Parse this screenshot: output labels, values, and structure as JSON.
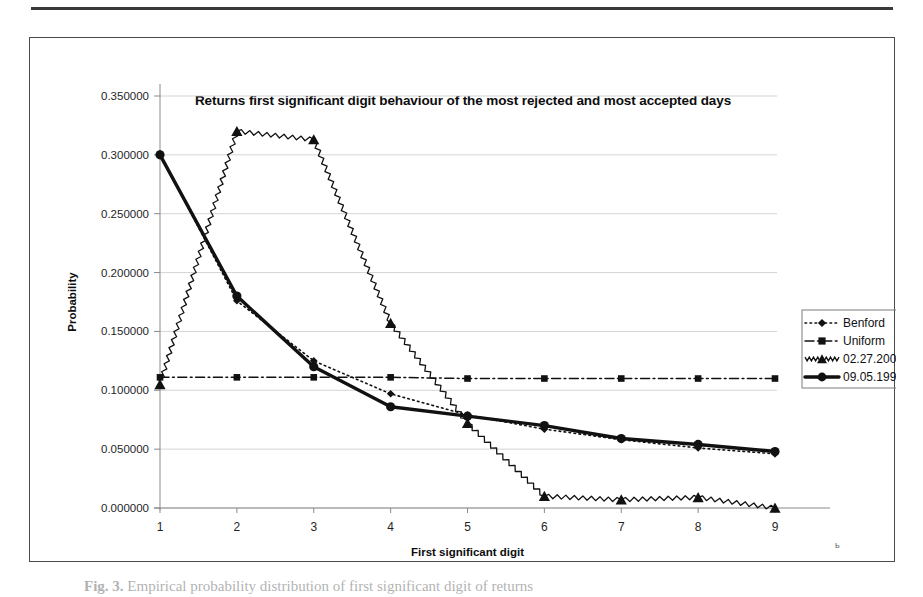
{
  "figure": {
    "caption_prefix": "Fig. 3.",
    "caption_text": " Empirical probability distribution of first significant digit of returns"
  },
  "chart_data": {
    "type": "line",
    "title": "Returns first significant digit behaviour of the most rejected and most accepted days",
    "xlabel": "First significant digit",
    "ylabel": "Probability",
    "categories": [
      "1",
      "2",
      "3",
      "4",
      "5",
      "6",
      "7",
      "8",
      "9"
    ],
    "x": [
      1,
      2,
      3,
      4,
      5,
      6,
      7,
      8,
      9
    ],
    "ylim": [
      0.0,
      0.35
    ],
    "yticks": [
      0.0,
      0.05,
      0.1,
      0.15,
      0.2,
      0.25,
      0.3,
      0.35
    ],
    "ytick_labels": [
      "0.000000",
      "0.050000",
      "0.100000",
      "0.150000",
      "0.200000",
      "0.250000",
      "0.300000",
      "0.350000"
    ],
    "grid": true,
    "legend_position": "right",
    "series": [
      {
        "name": "Benford",
        "style": "dotted",
        "marker": "diamond",
        "values": [
          0.301,
          0.176,
          0.125,
          0.097,
          0.079,
          0.067,
          0.058,
          0.051,
          0.046
        ]
      },
      {
        "name": "Uniform",
        "style": "dash-dot",
        "marker": "square",
        "values": [
          0.111,
          0.111,
          0.111,
          0.111,
          0.11,
          0.11,
          0.11,
          0.11,
          0.11
        ]
      },
      {
        "name": "02.27.2007",
        "style": "zigzag",
        "marker": "triangle",
        "values": [
          0.105,
          0.32,
          0.313,
          0.157,
          0.072,
          0.01,
          0.007,
          0.009,
          0.0
        ]
      },
      {
        "name": "09.05.1995",
        "style": "solid-thick",
        "marker": "circle",
        "values": [
          0.3,
          0.18,
          0.12,
          0.086,
          0.078,
          0.07,
          0.059,
          0.054,
          0.048
        ]
      }
    ]
  },
  "legend": {
    "items": [
      {
        "label": "Benford"
      },
      {
        "label": "Uniform"
      },
      {
        "label": "02.27.2007"
      },
      {
        "label": "09.05.1995"
      }
    ]
  },
  "artifacts": {
    "stray_mark": "ь"
  }
}
